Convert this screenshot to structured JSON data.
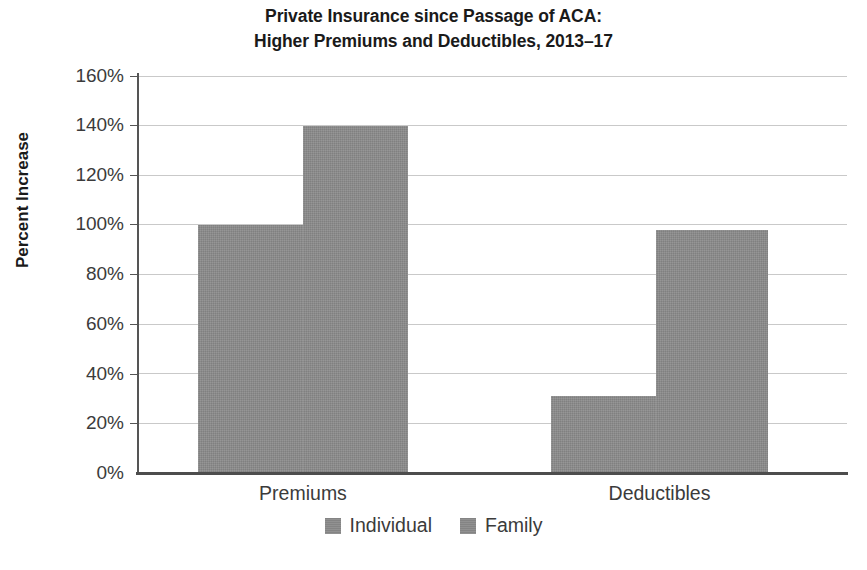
{
  "chart_data": {
    "type": "bar",
    "title": "Private Insurance since Passage of ACA: Higher Premiums and Deductibles, 2013–17",
    "title_lines": [
      "Private Insurance since Passage of ACA:",
      "Higher Premiums and Deductibles, 2013–17"
    ],
    "xlabel": "",
    "ylabel": "Percent Increase",
    "categories": [
      "Premiums",
      "Deductibles"
    ],
    "series": [
      {
        "name": "Individual",
        "values": [
          100,
          31
        ],
        "color": "#8b8b8b"
      },
      {
        "name": "Family",
        "values": [
          140,
          98
        ],
        "color": "#8b8b8b"
      }
    ],
    "ylim": [
      0,
      160
    ],
    "ytick_values": [
      0,
      20,
      40,
      60,
      80,
      100,
      120,
      140,
      160
    ],
    "ytick_labels": [
      "0%",
      "20%",
      "40%",
      "60%",
      "80%",
      "100%",
      "120%",
      "140%",
      "160%"
    ],
    "value_suffix": "%",
    "grid": true,
    "grid_axis": "y",
    "grid_color": "#c9c9c9",
    "legend_position": "bottom",
    "bar_group_gap": true,
    "axis_color": "#4d4d4d",
    "text_color": "#3b3b3b"
  },
  "legend": {
    "items": [
      {
        "label": "Individual",
        "swatch": "legend-swatch-individual"
      },
      {
        "label": "Family",
        "swatch": "legend-swatch-family"
      }
    ]
  },
  "caption": {
    "sliver_text": ""
  }
}
